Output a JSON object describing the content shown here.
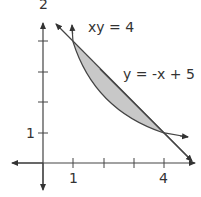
{
  "figure": {
    "curve_label": "xy = 4",
    "line_label": "y = -x + 5",
    "x_tick_labels": [
      "1",
      "4"
    ],
    "y_tick_labels": [
      "1",
      "2"
    ],
    "intersections": [
      [
        1,
        4
      ],
      [
        4,
        1
      ]
    ],
    "shaded_region": "between y = -x + 5 (above) and xy = 4 (below) for 1 ≤ x ≤ 4",
    "colors": {
      "axis": "#444444",
      "curve": "#444444",
      "fill": "#c8c8c8",
      "text": "#333333"
    }
  }
}
